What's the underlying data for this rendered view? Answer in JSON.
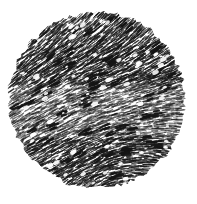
{
  "figure": {
    "type": "halftone-micrograph-circle",
    "canvas": {
      "width": 197,
      "height": 204
    },
    "background_color": "#ffffff",
    "ink_color": "#141414",
    "circle": {
      "cx": 97,
      "cy": 100,
      "r": 88,
      "edge_jitter": 2.5
    },
    "texture": {
      "seed": 1337,
      "spacing": 2.25,
      "stroke_length_min": 4,
      "stroke_length_max": 9,
      "stroke_width_min": 0.7,
      "stroke_width_max": 1.5,
      "base_alpha": 0.88,
      "skip_probability": 0.1,
      "angle_grid": {
        "xs": [
          10,
          97,
          184
        ],
        "ys": [
          10,
          100,
          191
        ],
        "deg": [
          [
            -48,
            -45,
            -52
          ],
          [
            -32,
            -18,
            -12
          ],
          [
            -30,
            -32,
            42
          ]
        ]
      },
      "light_band": {
        "y0": 85,
        "y1": 138,
        "extra_skip": 0.14,
        "alpha_scale": 0.72
      },
      "dark_clusters": {
        "count": 48,
        "strokes_per_cluster": 4,
        "width": 2.6,
        "alpha": 0.95
      },
      "white_specks": {
        "count": 95,
        "min_size": 1.2,
        "max_size": 3.6
      }
    }
  }
}
